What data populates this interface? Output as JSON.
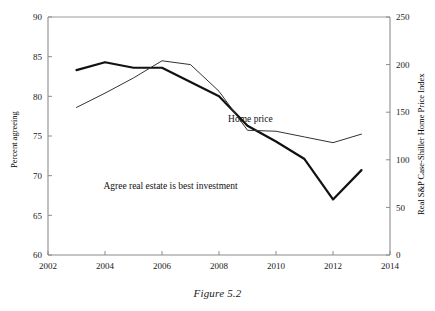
{
  "figure": {
    "caption": "Figure 5.2"
  },
  "chart_data": {
    "type": "line",
    "title": "",
    "xlabel": "",
    "ylabel": "Percent agreeing",
    "y2label": "Real S&P Case-Shiller Home Price Index",
    "xlim": [
      2002,
      2014
    ],
    "ylim": [
      60,
      90
    ],
    "y2lim": [
      0,
      250
    ],
    "xticks": [
      2002,
      2004,
      2006,
      2008,
      2010,
      2012,
      2014
    ],
    "xticklabels": [
      "2002",
      "2004",
      "2006",
      "2008",
      "2010",
      "2012",
      "2014"
    ],
    "yticks": [
      60,
      65,
      70,
      75,
      80,
      85,
      90
    ],
    "yticklabels": [
      "60",
      "65",
      "70",
      "75",
      "80",
      "85",
      "90"
    ],
    "y2ticks": [
      0,
      50,
      100,
      150,
      200,
      250
    ],
    "y2ticklabels": [
      "0",
      "50",
      "100",
      "150",
      "200",
      "250"
    ],
    "grid": false,
    "legend_position": "inline-annotations",
    "series": [
      {
        "name": "Agree real estate is best investment",
        "axis": "left",
        "style": "thick",
        "color": "#111111",
        "x": [
          2003,
          2004,
          2005,
          2006,
          2007,
          2008,
          2009,
          2010,
          2011,
          2012,
          2013
        ],
        "values": [
          83.3,
          84.3,
          83.6,
          83.6,
          81.8,
          80.0,
          76.3,
          74.3,
          72.1,
          67.0,
          70.7
        ]
      },
      {
        "name": "Home price",
        "axis": "right",
        "style": "thin",
        "color": "#333333",
        "x": [
          2003,
          2004,
          2005,
          2006,
          2007,
          2008,
          2009,
          2010,
          2011,
          2012,
          2013
        ],
        "values": [
          155,
          170,
          186,
          204,
          200,
          172,
          131,
          130,
          124,
          118,
          127
        ]
      }
    ],
    "annotations": [
      {
        "text": "Home price",
        "x": 2009.1,
        "y_left_axis": 76.8
      },
      {
        "text": "Agree real estate is best investment",
        "x": 2006.3,
        "y_left_axis": 68.3
      }
    ]
  }
}
